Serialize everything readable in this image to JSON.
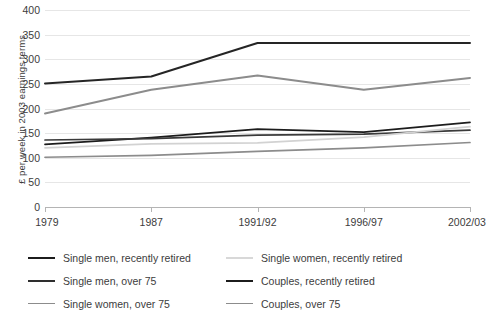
{
  "chart_data": {
    "type": "line",
    "title": "",
    "subtitle": "",
    "xlabel": "",
    "ylabel": "£ per week in 2003 earnings terms",
    "categories": [
      "1979",
      "1987",
      "1991/92",
      "1996/97",
      "2002/03"
    ],
    "x_tick_labels": [
      "1979",
      "1987",
      "1991/92",
      "1996/97",
      "2002/03"
    ],
    "y_tick_labels": [
      "0",
      "50",
      "100",
      "150",
      "200",
      "250",
      "300",
      "350",
      "400"
    ],
    "y_ticks": [
      0,
      50,
      100,
      150,
      200,
      250,
      300,
      350,
      400
    ],
    "ylim": [
      0,
      400
    ],
    "grid": "horizontal",
    "legend_position": "below",
    "series": [
      {
        "name": "Single men, recently retired",
        "color": "#1c1c1c",
        "width": 1.7,
        "values": [
          127,
          141,
          158,
          152,
          172
        ]
      },
      {
        "name": "Single men, over 75",
        "color": "#3a3a3a",
        "width": 1.7,
        "values": [
          136,
          139,
          146,
          148,
          156
        ]
      },
      {
        "name": "Single women, over 75",
        "color": "#8c8c8c",
        "width": 1.7,
        "values": [
          101,
          105,
          113,
          120,
          131
        ]
      },
      {
        "name": "Single women, recently retired",
        "color": "#d2d2d2",
        "width": 1.7,
        "values": [
          120,
          128,
          130,
          142,
          163
        ]
      },
      {
        "name": "Couples, recently retired",
        "color": "#252525",
        "width": 2.0,
        "values": [
          251,
          265,
          333,
          333,
          333
        ]
      },
      {
        "name": "Couples, over 75",
        "color": "#8c8c8c",
        "width": 2.0,
        "values": [
          190,
          238,
          267,
          238,
          262
        ]
      }
    ]
  },
  "legend": {
    "items": [
      {
        "label": "Single men, recently retired",
        "color": "#1c1c1c",
        "width": "2.4px"
      },
      {
        "label": "Single women, recently retired",
        "color": "#d8d8d8",
        "width": "2.0px"
      },
      {
        "label": "Single men, over 75",
        "color": "#2e2e2e",
        "width": "2.4px"
      },
      {
        "label": "Couples, recently retired",
        "color": "#1c1c1c",
        "width": "2.6px"
      },
      {
        "label": "Single women, over 75",
        "color": "#8c8c8c",
        "width": "1.8px"
      },
      {
        "label": "Couples, over 75",
        "color": "#8c8c8c",
        "width": "1.8px"
      }
    ]
  },
  "colors": {
    "gridline": "#e6e6e6",
    "axis": "#b4b4b4",
    "text": "#3c3c3c",
    "background": "#ffffff"
  }
}
